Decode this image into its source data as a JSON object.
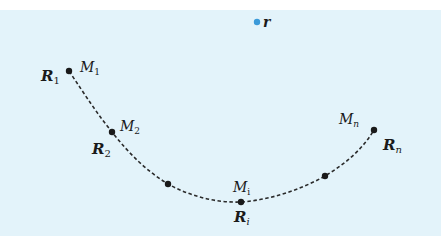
{
  "diagram": {
    "background_color": "#e3f3fa",
    "curve_color": "#2a2a2a",
    "point_color": "#1a1a1a",
    "observer_color": "#3b9ad9",
    "observer": {
      "label": "r",
      "x": 257,
      "y": 22
    },
    "points": [
      {
        "id": "R1",
        "bold_label": "R",
        "bold_sub": "1",
        "m_label": "M",
        "m_sub": "1",
        "x": 69,
        "y": 71
      },
      {
        "id": "R2",
        "bold_label": "R",
        "bold_sub": "2",
        "m_label": "M",
        "m_sub": "2",
        "x": 112,
        "y": 132
      },
      {
        "id": "mid-a",
        "x": 168,
        "y": 184
      },
      {
        "id": "Ri",
        "bold_label": "R",
        "bold_sub": "i",
        "m_label": "M",
        "m_sub": "i",
        "x": 241,
        "y": 202
      },
      {
        "id": "mid-b",
        "x": 325,
        "y": 176
      },
      {
        "id": "Rn",
        "bold_label": "R",
        "bold_sub": "n",
        "m_label": "M",
        "m_sub": "n",
        "x": 374,
        "y": 130
      }
    ]
  }
}
